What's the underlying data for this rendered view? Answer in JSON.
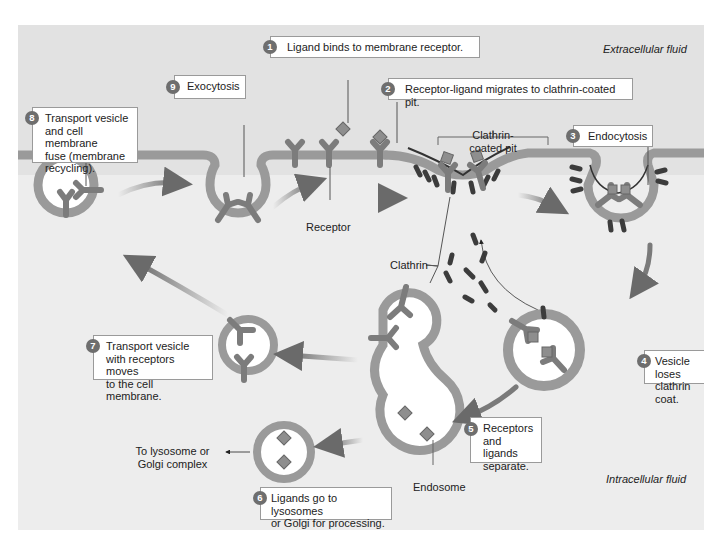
{
  "diagram": {
    "regions": {
      "extracellular": "Extracellular fluid",
      "intracellular": "Intracellular fluid"
    },
    "steps": [
      {
        "number": "1",
        "text": "Ligand binds to membrane receptor."
      },
      {
        "number": "2",
        "text": "Receptor-ligand migrates to clathrin-coated pit."
      },
      {
        "number": "3",
        "text": "Endocytosis"
      },
      {
        "number": "4",
        "text_lines": [
          "Vesicle loses",
          "clathrin coat."
        ]
      },
      {
        "number": "5",
        "text_lines": [
          "Receptors",
          "and ligands",
          "separate."
        ]
      },
      {
        "number": "6",
        "text_lines": [
          "Ligands go to lysosomes",
          "or Golgi for processing."
        ]
      },
      {
        "number": "7",
        "text_lines": [
          "Transport vesicle",
          "with receptors moves",
          "to the cell membrane."
        ]
      },
      {
        "number": "8",
        "text_lines": [
          "Transport vesicle",
          "and cell membrane",
          "fuse (membrane",
          "recycling)."
        ]
      },
      {
        "number": "9",
        "text": "Exocytosis"
      }
    ],
    "labels": {
      "receptor": "Receptor",
      "clathrin": "Clathrin",
      "coated_pit_lines": [
        "Clathrin-",
        "coated pit"
      ],
      "endosome": "Endosome",
      "lysosome_lines": [
        "To lysosome or",
        "Golgi complex"
      ]
    },
    "colors": {
      "membrane": "#9a9a9a",
      "receptor": "#7c7c7c",
      "ligand": "#8e8e8e",
      "clathrin": "#3c3c3c",
      "arrow": "#6a6a6a",
      "step_badge": "#6e6e6e",
      "panel_bg": "#e6e6e6"
    }
  }
}
